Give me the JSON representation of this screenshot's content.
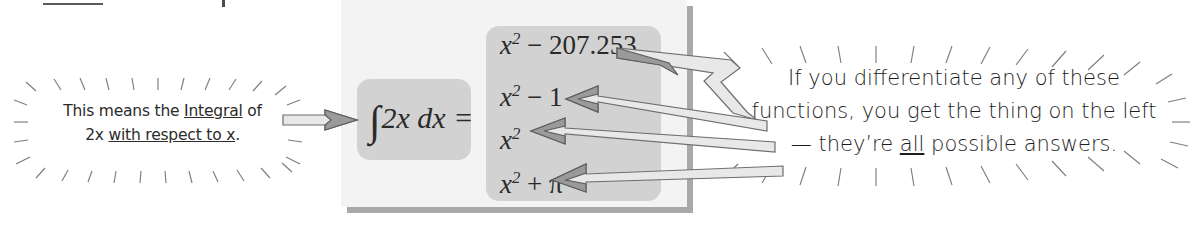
{
  "figure": {
    "type": "annotated-math-figure",
    "panel_bg": "#f3f3f3",
    "box_bg": "#d2d2d2",
    "shadow_color": "#a9a9a9"
  },
  "integral": {
    "integral_sign": "∫",
    "expression": "2x dx =",
    "integrand": "2x",
    "differential": "dx",
    "equals": "="
  },
  "answers": {
    "label": "possible-antiderivatives",
    "items": [
      {
        "base": "x",
        "exponent": "2",
        "rest": " − 207.253",
        "full": "x² − 207.253"
      },
      {
        "base": "x",
        "exponent": "2",
        "rest": " − 1",
        "full": "x² − 1"
      },
      {
        "base": "x",
        "exponent": "2",
        "rest": "",
        "full": "x²"
      },
      {
        "base": "x",
        "exponent": "2",
        "rest": " + π",
        "full": "x² + π"
      }
    ]
  },
  "caption_left": {
    "line1_a": "This means the ",
    "line1_underlined": "Integral",
    "line1_b": " of",
    "line2_a": "2x ",
    "line2_underlined": "with respect to x",
    "line2_b": "."
  },
  "caption_right": {
    "line1": "If you differentiate any of these",
    "line2": "functions, you get the thing on the left",
    "line3_a": "— they’re ",
    "line3_underlined": "all",
    "line3_b": " possible answers."
  },
  "arrows": {
    "left_pointer_name": "arrow-to-integral",
    "right_pointers_count": 4,
    "right_pointer_names": [
      "arrow-to-x2-minus-207",
      "arrow-to-x2-minus-1",
      "arrow-to-x2",
      "arrow-to-x2-plus-pi"
    ]
  },
  "colors": {
    "arrow_fill": "#e8e8e8",
    "arrow_stroke": "#6e6e6e",
    "arrow_solid": "#9a9a9a",
    "ray_stroke": "#7d7d7d",
    "text": "#2a2a2a"
  }
}
